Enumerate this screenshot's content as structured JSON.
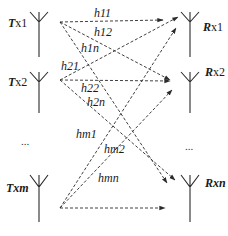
{
  "transmitters": [
    {
      "id": "tx1",
      "prefix": "T",
      "suffix": "x1",
      "y": 12
    },
    {
      "id": "tx2",
      "prefix": "T",
      "suffix": "x2",
      "y": 72
    },
    {
      "id": "txm",
      "prefix": "T",
      "suffix": "xm",
      "y": 175
    }
  ],
  "receivers": [
    {
      "id": "rx1",
      "prefix": "R",
      "suffix": "x1",
      "y": 12
    },
    {
      "id": "rx2",
      "prefix": "R",
      "suffix": "x2",
      "y": 72
    },
    {
      "id": "rxn",
      "prefix": "R",
      "suffix": "xn",
      "y": 175
    }
  ],
  "ellipsis": {
    "tx": "...",
    "rx": "..."
  },
  "channels": [
    {
      "label": "h11",
      "from": "tx1",
      "to": "rx1"
    },
    {
      "label": "h12",
      "from": "tx1",
      "to": "rx2"
    },
    {
      "label": "h1n",
      "from": "tx1",
      "to": "rxn"
    },
    {
      "label": "h21",
      "from": "tx2",
      "to": "rx1"
    },
    {
      "label": "h22",
      "from": "tx2",
      "to": "rx2"
    },
    {
      "label": "h2n",
      "from": "tx2",
      "to": "rxn"
    },
    {
      "label": "hm1",
      "from": "txm",
      "to": "rx1"
    },
    {
      "label": "hm2",
      "from": "txm",
      "to": "rx2"
    },
    {
      "label": "hmn",
      "from": "txm",
      "to": "rxn"
    }
  ],
  "colors": {
    "line": "#2a2a2a",
    "background": "#ffffff"
  }
}
